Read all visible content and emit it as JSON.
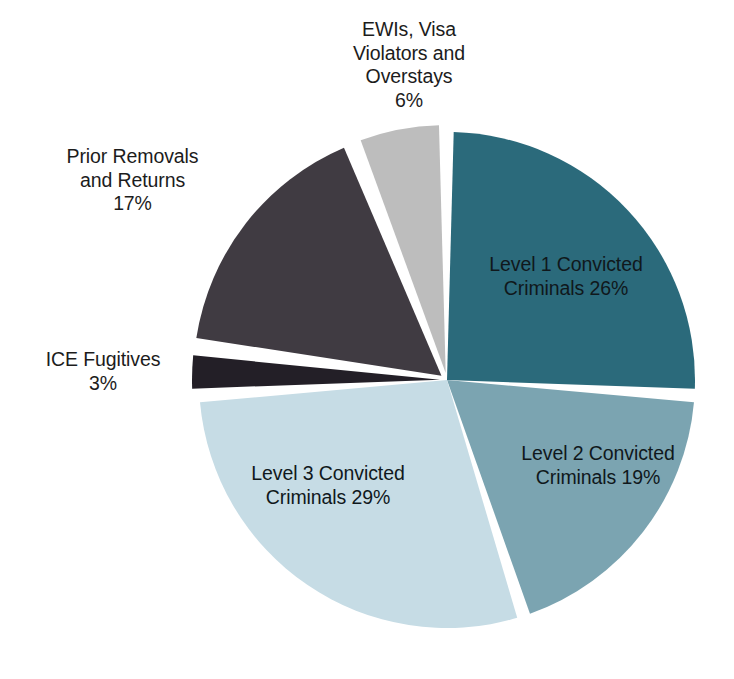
{
  "chart_data": {
    "type": "pie",
    "title": "",
    "xlabel": "",
    "ylabel": "",
    "grid": false,
    "legend": "none",
    "label_format": "name + percent",
    "start_angle_deg": 0,
    "direction": "clockwise",
    "center": {
      "x": 447,
      "y": 380
    },
    "radius": 248,
    "categories": [
      "Level 1 Convicted Criminals",
      "Level 2 Convicted Criminals",
      "Level 3 Convicted Criminals",
      "ICE Fugitives",
      "Prior Removals and Returns",
      "EWIs, Visa Violators and Overstays"
    ],
    "values": [
      26,
      19,
      29,
      3,
      17,
      6
    ],
    "units": "percent",
    "colors": [
      "#2b6a7b",
      "#7ba4b1",
      "#c6dce5",
      "#231f27",
      "#403b42",
      "#bdbdbd"
    ],
    "slices": [
      {
        "name": "Level 1 Convicted Criminals",
        "value": 26,
        "percent_label": "26%",
        "color": "#2b6a7b",
        "start_deg": 0,
        "end_deg": 93.6,
        "explode": 0,
        "label_position": "inside",
        "label_text": "Level 1 Convicted\nCriminals 26%"
      },
      {
        "name": "Level 2 Convicted Criminals",
        "value": 19,
        "percent_label": "19%",
        "color": "#7ba4b1",
        "start_deg": 93.6,
        "end_deg": 162.0,
        "explode": 0,
        "label_position": "inside",
        "label_text": "Level 2 Convicted\nCriminals 19%"
      },
      {
        "name": "Level 3 Convicted Criminals",
        "value": 29,
        "percent_label": "29%",
        "color": "#c6dce5",
        "start_deg": 162.0,
        "end_deg": 266.4,
        "explode": 0,
        "label_position": "inside",
        "label_text": "Level 3 Convicted\nCriminals 29%"
      },
      {
        "name": "ICE Fugitives",
        "value": 3,
        "percent_label": "3%",
        "color": "#231f27",
        "start_deg": 266.4,
        "end_deg": 277.2,
        "explode": 7,
        "label_position": "outside-left",
        "label_text": "ICE Fugitives\n3%"
      },
      {
        "name": "Prior Removals and Returns",
        "value": 17,
        "percent_label": "17%",
        "color": "#403b42",
        "start_deg": 277.2,
        "end_deg": 338.4,
        "explode": 7,
        "label_position": "outside-left",
        "label_text": "Prior Removals\nand Returns\n17%"
      },
      {
        "name": "EWIs, Visa Violators and Overstays",
        "value": 6,
        "percent_label": "6%",
        "color": "#bdbdbd",
        "start_deg": 338.4,
        "end_deg": 360.0,
        "explode": 7,
        "label_position": "outside-top",
        "label_text": "EWIs, Visa\nViolators and\nOverstays\n6%"
      }
    ]
  },
  "labels": {
    "ewis": "EWIs, Visa\nViolators and\nOverstays\n6%",
    "prior_removals": "Prior Removals\nand Returns\n17%",
    "ice_fugitives": "ICE Fugitives\n3%",
    "level1": "Level 1 Convicted\nCriminals 26%",
    "level2": "Level 2 Convicted\nCriminals 19%",
    "level3": "Level 3 Convicted\nCriminals 29%"
  },
  "page": {
    "background": "#ffffff",
    "separator_color": "#ffffff"
  }
}
